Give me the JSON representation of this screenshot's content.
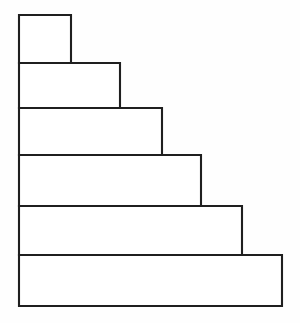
{
  "figure": {
    "shape_count": 6,
    "canvas": {
      "width": 300,
      "height": 323
    },
    "colors": {
      "background": "#fefefe",
      "fill": "#ffffff",
      "stroke": "#1f1f1f"
    },
    "stroke_width": 2,
    "common_left_edge_x": 19,
    "steps": [
      {
        "index": 1,
        "name": "step-1",
        "x": 19,
        "y": 15,
        "width": 52,
        "height": 48,
        "right": 71,
        "bottom": 63
      },
      {
        "index": 2,
        "name": "step-2",
        "x": 19,
        "y": 63,
        "width": 101,
        "height": 45,
        "right": 120,
        "bottom": 108
      },
      {
        "index": 3,
        "name": "step-3",
        "x": 19,
        "y": 108,
        "width": 143,
        "height": 47,
        "right": 162,
        "bottom": 155
      },
      {
        "index": 4,
        "name": "step-4",
        "x": 19,
        "y": 155,
        "width": 182,
        "height": 51,
        "right": 201,
        "bottom": 206
      },
      {
        "index": 5,
        "name": "step-5",
        "x": 19,
        "y": 206,
        "width": 223,
        "height": 49,
        "right": 242,
        "bottom": 255
      },
      {
        "index": 6,
        "name": "step-6",
        "x": 19,
        "y": 255,
        "width": 263,
        "height": 51,
        "right": 282,
        "bottom": 306
      }
    ]
  },
  "chart_data": {
    "type": "bar",
    "orientation": "horizontal",
    "title": "",
    "subtitle": "",
    "xlabel": "",
    "ylabel": "",
    "categories": [
      "1",
      "2",
      "3",
      "4",
      "5",
      "6"
    ],
    "values": [
      52,
      101,
      143,
      182,
      223,
      263
    ],
    "bar_heights": [
      48,
      45,
      47,
      51,
      49,
      51
    ],
    "xlim": [
      0,
      263
    ],
    "grid": false,
    "legend": null,
    "annotations": []
  }
}
